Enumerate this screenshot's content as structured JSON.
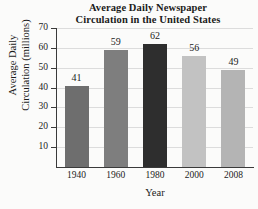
{
  "chart_data": {
    "type": "bar",
    "title": "Average Daily Newspaper Circulation in the United States",
    "title_lines": [
      "Average Daily Newspaper",
      "Circulation in the United States"
    ],
    "xlabel": "Year",
    "ylabel": "Average Daily Circulation (millions)",
    "ylabel_lines": [
      "Average Daily",
      "Circulation (millions)"
    ],
    "categories": [
      "1940",
      "1960",
      "1980",
      "2000",
      "2008"
    ],
    "values": [
      41,
      59,
      62,
      56,
      49
    ],
    "value_labels": [
      "41",
      "59",
      "62",
      "56",
      "49"
    ],
    "bar_colors": [
      "#6e6e6e",
      "#7e7e7e",
      "#2e2e2e",
      "#c2c2c2",
      "#b4b4b4"
    ],
    "ylim": [
      0,
      70
    ],
    "ytick_values": [
      70,
      60,
      50,
      40,
      30,
      20,
      10
    ],
    "ytick_labels": [
      "70",
      "60",
      "50",
      "40",
      "30",
      "20",
      "10"
    ],
    "grid": true,
    "grid_axis": "y",
    "grid_color": "#dcdcdc",
    "legend": null,
    "axis_color": "#3a3a3a",
    "background_color": "#fbfbfa",
    "text_color": "#1b1b1b"
  }
}
